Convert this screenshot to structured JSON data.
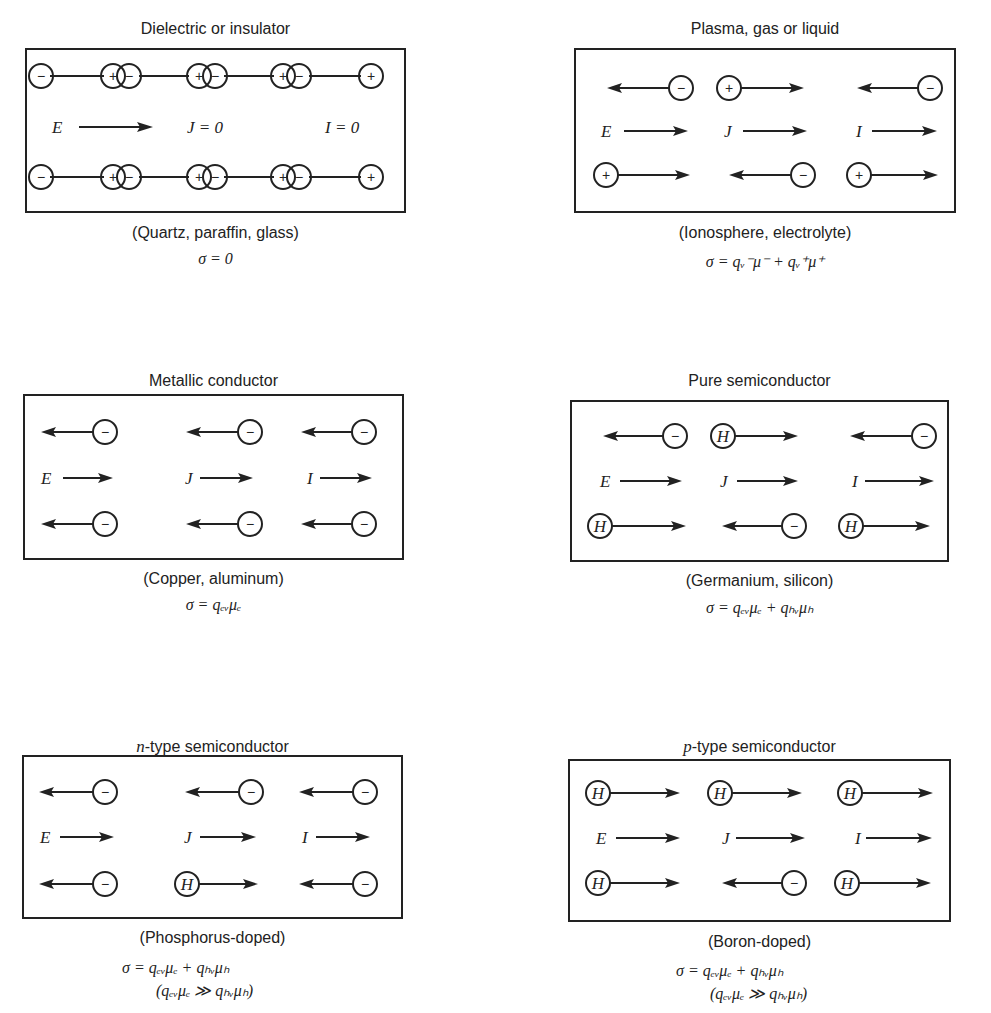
{
  "panels": [
    {
      "id": "dielectric",
      "title": "Dielectric or insulator",
      "examples": "(Quartz, paraffin, glass)",
      "formula": "σ = 0",
      "formula2": "",
      "labels": {
        "E": "E",
        "J": "J = 0",
        "I": "I = 0"
      },
      "rows": [
        [
          "−",
          "+",
          "−",
          "+",
          "−",
          "+",
          "−",
          "+"
        ],
        [
          "−",
          "+",
          "−",
          "+",
          "−",
          "+",
          "−",
          "+"
        ]
      ]
    },
    {
      "id": "plasma",
      "title": "Plasma, gas or liquid",
      "examples": "(Ionosphere, electrolyte)",
      "formula": "σ = qᵥ⁻μ⁻ + qᵥ⁺μ⁺",
      "formula2": "",
      "labels": {
        "E": "E",
        "J": "J",
        "I": "I"
      },
      "rows": [
        [
          {
            "carrier": "−",
            "dir": "left"
          },
          {
            "carrier": "+",
            "dir": "right"
          },
          {
            "carrier": "−",
            "dir": "left"
          }
        ],
        [
          {
            "carrier": "+",
            "dir": "right"
          },
          {
            "carrier": "−",
            "dir": "left"
          },
          {
            "carrier": "+",
            "dir": "right"
          }
        ]
      ]
    },
    {
      "id": "metallic",
      "title": "Metallic conductor",
      "examples": "(Copper, aluminum)",
      "formula": "σ = qₑᵥμₑ",
      "formula2": "",
      "labels": {
        "E": "E",
        "J": "J",
        "I": "I"
      },
      "rows": [
        [
          {
            "carrier": "−",
            "dir": "left"
          },
          {
            "carrier": "−",
            "dir": "left"
          },
          {
            "carrier": "−",
            "dir": "left"
          }
        ],
        [
          {
            "carrier": "−",
            "dir": "left"
          },
          {
            "carrier": "−",
            "dir": "left"
          },
          {
            "carrier": "−",
            "dir": "left"
          }
        ]
      ]
    },
    {
      "id": "pure",
      "title": "Pure semiconductor",
      "examples": "(Germanium, silicon)",
      "formula": "σ = qₑᵥμₑ + qₕᵥμₕ",
      "formula2": "",
      "labels": {
        "E": "E",
        "J": "J",
        "I": "I"
      },
      "rows": [
        [
          {
            "carrier": "−",
            "dir": "left"
          },
          {
            "carrier": "H",
            "dir": "right"
          },
          {
            "carrier": "−",
            "dir": "left"
          }
        ],
        [
          {
            "carrier": "H",
            "dir": "right"
          },
          {
            "carrier": "−",
            "dir": "left"
          },
          {
            "carrier": "H",
            "dir": "right"
          }
        ]
      ]
    },
    {
      "id": "ntype",
      "title_prefix": "n",
      "title": "-type semiconductor",
      "examples": "(Phosphorus-doped)",
      "formula": "σ = qₑᵥμₑ + qₕᵥμₕ",
      "formula2": "(qₑᵥμₑ ≫ qₕᵥμₕ)",
      "labels": {
        "E": "E",
        "J": "J",
        "I": "I"
      },
      "rows": [
        [
          {
            "carrier": "−",
            "dir": "left"
          },
          {
            "carrier": "−",
            "dir": "left"
          },
          {
            "carrier": "−",
            "dir": "left"
          }
        ],
        [
          {
            "carrier": "−",
            "dir": "left"
          },
          {
            "carrier": "H",
            "dir": "right"
          },
          {
            "carrier": "−",
            "dir": "left"
          }
        ]
      ]
    },
    {
      "id": "ptype",
      "title_prefix": "p",
      "title": "-type semiconductor",
      "examples": "(Boron-doped)",
      "formula": "σ = qₑᵥμₑ + qₕᵥμₕ",
      "formula2": "(qₑᵥμₑ ≫ qₕᵥμₕ)",
      "labels": {
        "E": "E",
        "J": "J",
        "I": "I"
      },
      "rows": [
        [
          {
            "carrier": "H",
            "dir": "right"
          },
          {
            "carrier": "H",
            "dir": "right"
          },
          {
            "carrier": "H",
            "dir": "right"
          }
        ],
        [
          {
            "carrier": "H",
            "dir": "right"
          },
          {
            "carrier": "−",
            "dir": "left"
          },
          {
            "carrier": "H",
            "dir": "right"
          }
        ]
      ]
    }
  ]
}
